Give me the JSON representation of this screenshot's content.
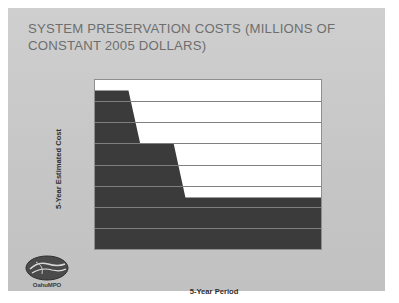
{
  "slide": {
    "title": "SYSTEM PRESERVATION COSTS (MILLIONS OF CONSTANT 2005 DOLLARS)",
    "background_color": "#c8c8c8"
  },
  "logo": {
    "name": "OahuMPO",
    "text": "OahuMPO"
  },
  "chart_data": {
    "type": "area",
    "title": "SYSTEM PRESERVATION COSTS (MILLIONS OF CONSTANT 2005 DOLLARS)",
    "categories": [
      "2006-2010",
      "2011-2015",
      "2016-2020",
      "2021-2025",
      "2026-2030"
    ],
    "values": [
      375,
      250,
      122,
      122,
      122
    ],
    "xlabel": "5-Year Period",
    "ylabel": "5-Year Estimated Cost",
    "ylim": [
      0,
      400
    ],
    "ytick_values": [
      0,
      50,
      100,
      150,
      200,
      250,
      300,
      350,
      400
    ],
    "ytick_labels": [
      "$0",
      "$50",
      "$100",
      "$150",
      "$200",
      "$250",
      "$300",
      "$350",
      "$400"
    ],
    "grid": true,
    "legend": "none",
    "series_color": "#3b3b3b",
    "plot_background": "#ffffff",
    "gridline_color": "#7f7f7f",
    "units": "millions of constant 2005 dollars"
  }
}
